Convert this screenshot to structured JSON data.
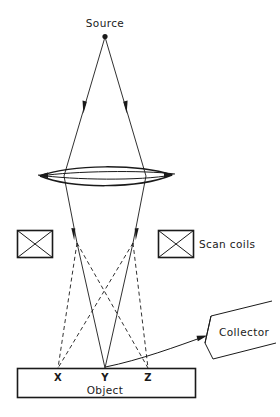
{
  "figure": {
    "background_color": "#ffffff",
    "ink_color": "#1a1a1a",
    "width": 280,
    "height": 417
  },
  "labels": {
    "source": "Source",
    "scan_coils": "Scan coils",
    "collector": "Collector",
    "object": "Object",
    "point_x": "X",
    "point_y": "Y",
    "point_z": "Z"
  },
  "components": {
    "source_point": {
      "name": "electron-source",
      "x": 105,
      "y": 36
    },
    "lens": {
      "name": "condenser-lens",
      "left_x": 40,
      "right_x": 172,
      "center_y": 175,
      "half_height": 9
    },
    "scan_coil_left": {
      "x": 17,
      "y": 230,
      "width": 35,
      "height": 28
    },
    "scan_coil_right": {
      "x": 158,
      "y": 230,
      "width": 35,
      "height": 28
    },
    "deflection_point_left": {
      "x": 77,
      "y": 243
    },
    "deflection_point_right": {
      "x": 133,
      "y": 243
    },
    "object_bar": {
      "x": 17,
      "y": 368,
      "width": 178,
      "height": 30
    },
    "specimen_points": {
      "x_pos": 58,
      "y_pos": 105,
      "z_pos": 148,
      "surface_y": 368
    },
    "collector": {
      "name": "secondary-electron-collector",
      "tilt_degrees": -18,
      "mouth_left_x": 203,
      "center_y": 330
    }
  },
  "rays": {
    "illumination_arrow_y": 108,
    "scan_arrow_y": 236,
    "solid_ray_targets": [
      "Y"
    ],
    "dashed_ray_targets": [
      "X",
      "Z"
    ],
    "collector_signal_from": "Y"
  }
}
